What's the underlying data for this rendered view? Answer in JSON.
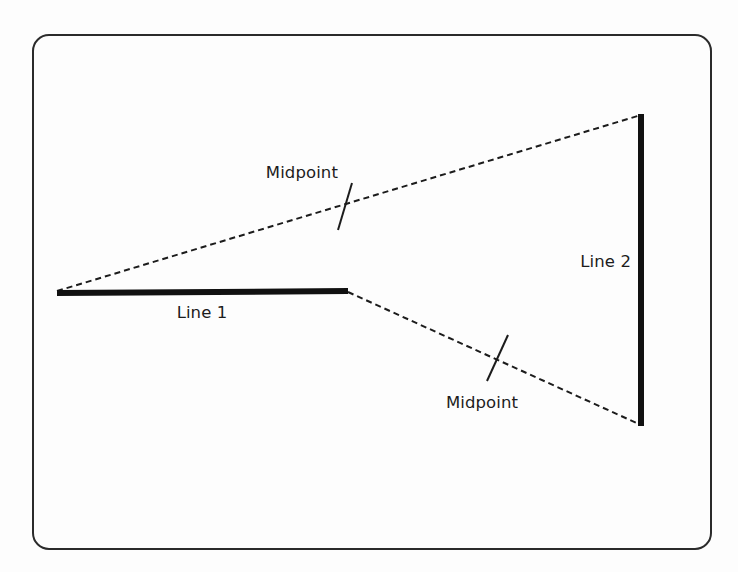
{
  "figure": {
    "name": "midpoint-line-diagram",
    "background_color": "#fdfdfd",
    "ink_color": "#1c1c1c",
    "frame": {
      "name": "rounded-rectangle-frame",
      "x": 33,
      "y": 35,
      "width": 678,
      "height": 514,
      "corner_radius": 16,
      "stroke_width": 2,
      "stroke_color": "#2b2b2b"
    },
    "solid_lines": [
      {
        "id": "line-1",
        "label": "Line 1",
        "orientation": "horizontal",
        "x1": 57,
        "y1": 293,
        "x2": 348,
        "y2": 291,
        "stroke_width": 6,
        "label_x": 202,
        "label_y": 318,
        "label_anchor": "middle"
      },
      {
        "id": "line-2",
        "label": "Line 2",
        "orientation": "vertical",
        "x1": 641,
        "y1": 114,
        "x2": 641,
        "y2": 426,
        "stroke_width": 6,
        "label_x": 631,
        "label_y": 267,
        "label_anchor": "end"
      }
    ],
    "dashed_connectors": [
      {
        "id": "upper-connector",
        "from": "line-1-left-endpoint",
        "to": "line-2-top-endpoint",
        "x1": 57,
        "y1": 291,
        "x2": 641,
        "y2": 115,
        "stroke_width": 2,
        "dash_pattern": "6 4"
      },
      {
        "id": "lower-connector",
        "from": "line-1-right-endpoint",
        "to": "line-2-bottom-endpoint",
        "x1": 348,
        "y1": 292,
        "x2": 641,
        "y2": 425,
        "stroke_width": 2,
        "dash_pattern": "6 4"
      }
    ],
    "midpoints": [
      {
        "id": "upper-midpoint",
        "label": "Midpoint",
        "tick_center_x": 345,
        "tick_center_y": 206,
        "tick_x1": 352,
        "tick_y1": 183,
        "tick_x2": 338,
        "tick_y2": 230,
        "tick_stroke_width": 2,
        "label_x": 338,
        "label_y": 178,
        "label_anchor": "end"
      },
      {
        "id": "lower-midpoint",
        "label": "Midpoint",
        "tick_center_x": 497,
        "tick_center_y": 358,
        "tick_x1": 508,
        "tick_y1": 335,
        "tick_x2": 487,
        "tick_y2": 381,
        "tick_stroke_width": 2,
        "label_x": 482,
        "label_y": 408,
        "label_anchor": "middle"
      }
    ]
  }
}
